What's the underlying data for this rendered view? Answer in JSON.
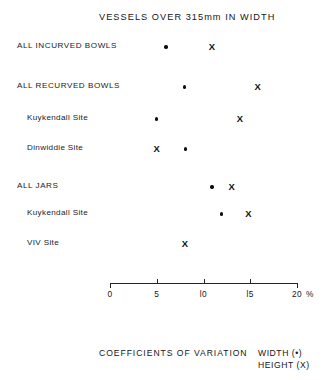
{
  "chart_data": {
    "type": "scatter",
    "title": "VESSELS OVER 315mm IN WIDTH",
    "xlabel": "COEFFICIENTS OF VARIATION",
    "ylabel": "",
    "xlim": [
      0,
      20
    ],
    "xticks": [
      0,
      5,
      10,
      15,
      20
    ],
    "xtick_labels": [
      "0",
      "5",
      "l0",
      "l5",
      "20"
    ],
    "x_unit": "%",
    "grid": false,
    "legend_position": "bottom-right",
    "series": [
      {
        "name": "WIDTH (•)",
        "marker": "dot",
        "symbol": "•"
      },
      {
        "name": "HEIGHT (X)",
        "marker": "x",
        "symbol": "X"
      }
    ],
    "categories": [
      "ALL INCURVED BOWLS",
      "ALL RECURVED BOWLS",
      "Kuykendall Site",
      "Dinwiddie Site",
      "ALL JARS",
      "Kuykendall Site",
      "VIV Site"
    ],
    "points": [
      {
        "category": "ALL INCURVED BOWLS",
        "width": 6.0,
        "height": 10.9
      },
      {
        "category": "ALL RECURVED BOWLS",
        "width": 8.0,
        "height": 15.8
      },
      {
        "category": "Kuykendall Site",
        "width": 5.0,
        "height": 13.9
      },
      {
        "category": "Dinwiddie Site",
        "width": 8.1,
        "height": 5.0
      },
      {
        "category": "ALL JARS",
        "width": 10.9,
        "height": 13.0
      },
      {
        "category": "Kuykendall Site",
        "width": 11.9,
        "height": 14.8
      },
      {
        "category": "VIV Site",
        "width": null,
        "height": 8.0
      }
    ]
  },
  "header": {
    "title": "VESSELS OVER 315mm IN WIDTH"
  },
  "rows": [
    {
      "label": "ALL INCURVED BOWLS",
      "level": 0,
      "top": 39,
      "width": 6.0,
      "height": 10.9
    },
    {
      "label": "ALL RECURVED BOWLS",
      "level": 0,
      "top": 79,
      "width": 8.0,
      "height": 15.8
    },
    {
      "label": "Kuykendall Site",
      "level": 1,
      "top": 111,
      "width": 5.0,
      "height": 13.9
    },
    {
      "label": "Dinwiddie Site",
      "level": 1,
      "top": 141,
      "width": 8.1,
      "height": 5.0
    },
    {
      "label": "ALL JARS",
      "level": 0,
      "top": 179,
      "width": 10.9,
      "height": 13.0
    },
    {
      "label": "Kuykendall Site",
      "level": 1,
      "top": 206,
      "width": 11.9,
      "height": 14.8
    },
    {
      "label": "VIV Site",
      "level": 1,
      "top": 236,
      "width": null,
      "height": 8.0
    }
  ],
  "axis": {
    "ticks": [
      {
        "value": 0,
        "label": "0"
      },
      {
        "value": 5,
        "label": "5"
      },
      {
        "value": 10,
        "label": "l0"
      },
      {
        "value": 15,
        "label": "l5"
      },
      {
        "value": 20,
        "label": "20"
      }
    ],
    "unit": "%"
  },
  "footer": {
    "caption": "COEFFICIENTS OF VARIATION",
    "legend": [
      "WIDTH (•)",
      "HEIGHT (X)"
    ]
  },
  "geometry": {
    "axis_x0_px": 110,
    "axis_x20_px": 297
  }
}
